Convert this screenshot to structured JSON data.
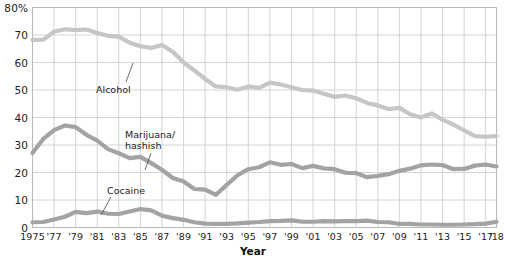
{
  "chart_data": {
    "type": "line",
    "title": "",
    "xlabel": "Year",
    "ylabel": "",
    "ylim": [
      0,
      80
    ],
    "xlim": [
      1975,
      2018
    ],
    "grid": true,
    "legend_position": "inline-annotations",
    "ytick_labels": [
      "80%",
      "70",
      "60",
      "50",
      "40",
      "30",
      "20",
      "10",
      "0"
    ],
    "ytick_values": [
      80,
      70,
      60,
      50,
      40,
      30,
      20,
      10,
      0
    ],
    "xtick_labels": [
      "1975",
      "'77",
      "'79",
      "'81",
      "'83",
      "'85",
      "'87",
      "'89",
      "'91",
      "'93",
      "'95",
      "'97",
      "'99",
      "'01",
      "'03",
      "'05",
      "'07",
      "'09",
      "'11",
      "'13",
      "'15",
      "'17",
      "'18"
    ],
    "xtick_values": [
      1975,
      1977,
      1979,
      1981,
      1983,
      1985,
      1987,
      1989,
      1991,
      1993,
      1995,
      1997,
      1999,
      2001,
      2003,
      2005,
      2007,
      2009,
      2011,
      2013,
      2015,
      2017,
      2018
    ],
    "x": [
      1975,
      1976,
      1977,
      1978,
      1979,
      1980,
      1981,
      1982,
      1983,
      1984,
      1985,
      1986,
      1987,
      1988,
      1989,
      1990,
      1991,
      1992,
      1993,
      1994,
      1995,
      1996,
      1997,
      1998,
      1999,
      2000,
      2001,
      2002,
      2003,
      2004,
      2005,
      2006,
      2007,
      2008,
      2009,
      2010,
      2011,
      2012,
      2013,
      2014,
      2015,
      2016,
      2017,
      2018
    ],
    "series": [
      {
        "name": "Alcohol",
        "color": "#c6c6c6",
        "values": [
          68.2,
          68.3,
          71.2,
          72.1,
          71.8,
          72.0,
          70.7,
          69.7,
          69.4,
          67.2,
          65.9,
          65.3,
          66.4,
          63.9,
          60.0,
          57.1,
          54.0,
          51.3,
          51.0,
          50.1,
          51.3,
          50.8,
          52.7,
          52.0,
          51.0,
          50.0,
          49.8,
          48.6,
          47.5,
          48.0,
          47.0,
          45.3,
          44.4,
          43.1,
          43.5,
          41.2,
          40.0,
          41.5,
          39.2,
          37.4,
          35.3,
          33.2,
          33.0,
          33.2
        ]
      },
      {
        "name": "Marijuana/\nhashish",
        "color": "#a3a3a3",
        "values": [
          27.1,
          32.2,
          35.4,
          37.1,
          36.5,
          33.7,
          31.6,
          28.5,
          27.0,
          25.2,
          25.7,
          23.4,
          21.0,
          18.0,
          16.7,
          14.0,
          13.8,
          11.9,
          15.5,
          19.0,
          21.2,
          21.9,
          23.7,
          22.8,
          23.1,
          21.6,
          22.4,
          21.5,
          21.2,
          19.9,
          19.8,
          18.3,
          18.8,
          19.4,
          20.6,
          21.4,
          22.6,
          22.9,
          22.7,
          21.2,
          21.3,
          22.5,
          22.9,
          22.2
        ]
      },
      {
        "name": "Cocaine",
        "color": "#a3a3a3",
        "values": [
          1.9,
          2.0,
          2.9,
          3.9,
          5.7,
          5.2,
          5.8,
          5.0,
          4.9,
          5.8,
          6.7,
          6.2,
          4.3,
          3.4,
          2.8,
          1.9,
          1.4,
          1.3,
          1.3,
          1.5,
          1.8,
          2.0,
          2.3,
          2.4,
          2.6,
          2.1,
          2.1,
          2.3,
          2.2,
          2.3,
          2.3,
          2.5,
          2.0,
          1.9,
          1.3,
          1.3,
          1.1,
          1.1,
          1.0,
          1.0,
          1.1,
          1.2,
          1.4,
          2.1
        ]
      }
    ],
    "annotations": [
      {
        "name": "alcohol",
        "label": "Alcohol",
        "x_px": 96,
        "y_px": 84,
        "leader": {
          "x1": 126,
          "y1": 82,
          "x2": 133,
          "y2": 63
        }
      },
      {
        "name": "marijuana",
        "label": "Marijuana/\nhashish",
        "x_px": 125,
        "y_px": 129,
        "leader": {
          "x1": 151,
          "y1": 153,
          "x2": 145,
          "y2": 170
        }
      },
      {
        "name": "cocaine",
        "label": "Cocaine",
        "x_px": 107,
        "y_px": 185,
        "leader": {
          "x1": 111,
          "y1": 197,
          "x2": 101,
          "y2": 215
        }
      }
    ]
  }
}
